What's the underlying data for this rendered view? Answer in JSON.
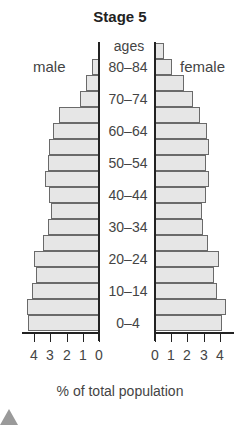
{
  "chart_data": {
    "type": "bar",
    "subtype": "population-pyramid",
    "title": "Stage 5",
    "xlabel": "% of total population",
    "ylabel": "ages",
    "left_label": "male",
    "right_label": "female",
    "categories": [
      "0-4",
      "5-9",
      "10-14",
      "15-19",
      "20-24",
      "25-29",
      "30-34",
      "35-39",
      "40-44",
      "45-49",
      "50-54",
      "55-59",
      "60-64",
      "65-69",
      "70-74",
      "75-79",
      "80-84",
      "85+"
    ],
    "series": [
      {
        "name": "male",
        "values": [
          4.3,
          4.4,
          4.05,
          3.8,
          3.95,
          3.4,
          3.1,
          2.9,
          3.05,
          3.3,
          3.1,
          3.0,
          2.8,
          2.4,
          1.1,
          0.75,
          0.4,
          0
        ]
      },
      {
        "name": "female",
        "values": [
          4.05,
          4.3,
          3.75,
          3.6,
          3.9,
          3.2,
          2.9,
          2.85,
          3.1,
          3.3,
          3.1,
          3.3,
          3.15,
          2.7,
          2.3,
          1.7,
          1.0,
          0.5
        ]
      }
    ],
    "shown_age_labels": [
      "80–84",
      "70–74",
      "60–64",
      "50–54",
      "40–44",
      "30–34",
      "20–24",
      "10–14",
      "0–4"
    ],
    "x_ticks_left": [
      "4",
      "3",
      "2",
      "1",
      "0"
    ],
    "x_ticks_right": [
      "0",
      "1",
      "2",
      "3",
      "4"
    ],
    "xlim": [
      0,
      4.5
    ],
    "grid": false,
    "colors": {
      "bar_fill": "#e6e6e6",
      "bar_border": "#6a6a6a",
      "axis": "#222222"
    }
  },
  "labels": {
    "title": "Stage 5",
    "ages": "ages",
    "male": "male",
    "female": "female",
    "xlabel": "% of total population"
  }
}
